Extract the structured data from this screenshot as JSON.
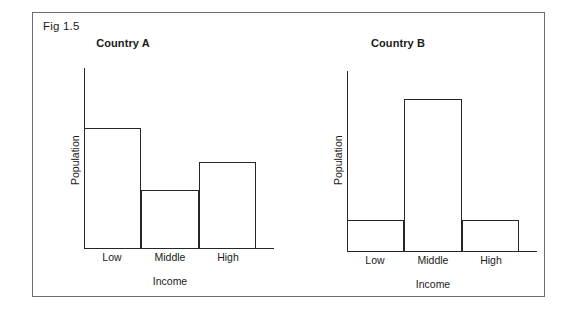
{
  "figure": {
    "label": "Fig 1.5"
  },
  "chart_data": [
    {
      "type": "bar",
      "title": "Country A",
      "xlabel": "Income",
      "ylabel": "Population",
      "categories": [
        "Low",
        "Middle",
        "High"
      ],
      "values": [
        68,
        33,
        49
      ],
      "ylim": [
        0,
        100
      ],
      "grid": false,
      "legend": "none",
      "axis_ticks": false
    },
    {
      "type": "bar",
      "title": "Country B",
      "xlabel": "Income",
      "ylabel": "Population",
      "categories": [
        "Low",
        "Middle",
        "High"
      ],
      "values": [
        18,
        86,
        18
      ],
      "ylim": [
        0,
        100
      ],
      "grid": false,
      "legend": "none",
      "axis_ticks": false
    }
  ],
  "colors": {
    "frame": "#6d6d6d",
    "axis": "#262626",
    "bar_outline": "#262626",
    "bar_fill": "#ffffff",
    "text": "#1a1a1a",
    "background": "#ffffff"
  }
}
